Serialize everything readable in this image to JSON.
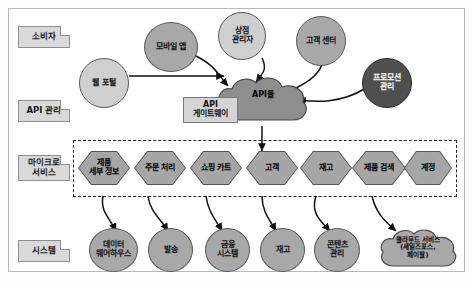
{
  "diagram": {
    "lanes": [
      {
        "id": "consumer",
        "label": "소비자"
      },
      {
        "id": "api-management",
        "label": "API 관리"
      },
      {
        "id": "microservices",
        "label": "마이크로\n서비스"
      },
      {
        "id": "systems",
        "label": "시스템"
      }
    ],
    "consumers": [
      {
        "id": "web-portal",
        "label": "웹 포털"
      },
      {
        "id": "mobile-app",
        "label": "모바일 앱"
      },
      {
        "id": "store-manager",
        "label": "상점\n관리자"
      },
      {
        "id": "customer-center",
        "label": "고객 센터"
      },
      {
        "id": "promotion-management",
        "label": "프로모션\n관리"
      }
    ],
    "api_layer": {
      "gateway_label": "API\n게이트웨이",
      "cloud_label": "API들"
    },
    "microservices": [
      {
        "id": "product-details",
        "label": "제품\n세부 정보"
      },
      {
        "id": "order-processing",
        "label": "주문 처리"
      },
      {
        "id": "shopping-cart",
        "label": "쇼핑 카트"
      },
      {
        "id": "customer",
        "label": "고객"
      },
      {
        "id": "inventory",
        "label": "재고"
      },
      {
        "id": "product-search",
        "label": "제품 검색"
      },
      {
        "id": "account",
        "label": "계정"
      }
    ],
    "systems": [
      {
        "id": "data-warehouse",
        "label": "데이터\n웨어하우스"
      },
      {
        "id": "shipping",
        "label": "발송"
      },
      {
        "id": "finance-system",
        "label": "금융\n시스템"
      },
      {
        "id": "inventory-system",
        "label": "재고"
      },
      {
        "id": "content-management",
        "label": "콘텐츠\n관리"
      },
      {
        "id": "cloud-services",
        "label": "클라우드 서비스\n(세일즈포스,\n페이팔)"
      }
    ],
    "colors": {
      "lane_fill": "#d9d9d9",
      "node_light": "#cfcfcf",
      "node_mid": "#a8a8a8",
      "node_dark": "#4f4f4f",
      "hex_fill": "#a6a6a6",
      "stroke": "#555555",
      "dashed_box": "#222222"
    }
  }
}
